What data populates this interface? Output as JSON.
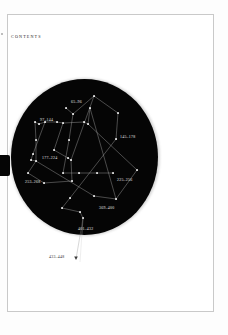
{
  "page": {
    "heading": "CONTENTS",
    "background_color": "#ffffff",
    "frame_color": "#c9c9c9",
    "disc_color": "#050505",
    "star_color": "#ffffff",
    "line_color": "#cfcfcf",
    "label_color": "#e8e8e8"
  },
  "chart_data": {
    "type": "scatter",
    "title": "CONTENTS",
    "xlabel": "",
    "ylabel": "",
    "grid": false,
    "legend_position": "none",
    "labels": [
      {
        "text": "65–96",
        "x": 71,
        "y": 100,
        "placement": "above-cluster"
      },
      {
        "text": "97–144",
        "x": 40,
        "y": 118,
        "placement": "above-cluster"
      },
      {
        "text": "145–178",
        "x": 120,
        "y": 135,
        "placement": "right-cluster"
      },
      {
        "text": "177–224",
        "x": 42,
        "y": 156,
        "placement": "inline-cluster"
      },
      {
        "text": "253–268",
        "x": 25,
        "y": 180,
        "placement": "left-cluster"
      },
      {
        "text": "225–256",
        "x": 117,
        "y": 178,
        "placement": "right-cluster"
      },
      {
        "text": "369–400",
        "x": 99,
        "y": 206,
        "placement": "below-cluster"
      },
      {
        "text": "401–432",
        "x": 78,
        "y": 227,
        "placement": "below-cluster"
      },
      {
        "text": "433–448",
        "x": 49,
        "y": 255,
        "placement": "outside-disc"
      }
    ],
    "stars": [
      {
        "x": 94,
        "y": 96
      },
      {
        "x": 66,
        "y": 108
      },
      {
        "x": 90,
        "y": 108
      },
      {
        "x": 73,
        "y": 114
      },
      {
        "x": 118,
        "y": 113
      },
      {
        "x": 35,
        "y": 122
      },
      {
        "x": 39,
        "y": 124
      },
      {
        "x": 45,
        "y": 122
      },
      {
        "x": 57,
        "y": 122
      },
      {
        "x": 63,
        "y": 123
      },
      {
        "x": 84,
        "y": 122
      },
      {
        "x": 88,
        "y": 124
      },
      {
        "x": 116,
        "y": 139
      },
      {
        "x": 36,
        "y": 140
      },
      {
        "x": 69,
        "y": 140
      },
      {
        "x": 33,
        "y": 154
      },
      {
        "x": 54,
        "y": 150
      },
      {
        "x": 31,
        "y": 160
      },
      {
        "x": 36,
        "y": 161
      },
      {
        "x": 68,
        "y": 158
      },
      {
        "x": 71,
        "y": 160
      },
      {
        "x": 137,
        "y": 170
      },
      {
        "x": 28,
        "y": 173
      },
      {
        "x": 63,
        "y": 173
      },
      {
        "x": 79,
        "y": 173
      },
      {
        "x": 97,
        "y": 173
      },
      {
        "x": 113,
        "y": 173
      },
      {
        "x": 44,
        "y": 183
      },
      {
        "x": 72,
        "y": 181
      },
      {
        "x": 94,
        "y": 196
      },
      {
        "x": 116,
        "y": 199
      },
      {
        "x": 70,
        "y": 198
      },
      {
        "x": 62,
        "y": 208
      },
      {
        "x": 80,
        "y": 212
      },
      {
        "x": 83,
        "y": 218
      }
    ],
    "links": [
      [
        94,
        96,
        118,
        113
      ],
      [
        94,
        96,
        73,
        114
      ],
      [
        66,
        108,
        73,
        114
      ],
      [
        90,
        108,
        88,
        124
      ],
      [
        118,
        113,
        116,
        139
      ],
      [
        35,
        122,
        39,
        124
      ],
      [
        39,
        124,
        45,
        122
      ],
      [
        45,
        122,
        57,
        122
      ],
      [
        57,
        122,
        63,
        123
      ],
      [
        63,
        123,
        84,
        122
      ],
      [
        84,
        122,
        88,
        124
      ],
      [
        35,
        122,
        36,
        140
      ],
      [
        36,
        140,
        36,
        161
      ],
      [
        31,
        160,
        36,
        161
      ],
      [
        33,
        154,
        31,
        160
      ],
      [
        45,
        122,
        33,
        154
      ],
      [
        63,
        123,
        54,
        150
      ],
      [
        54,
        150,
        68,
        158
      ],
      [
        68,
        158,
        71,
        160
      ],
      [
        71,
        160,
        72,
        181
      ],
      [
        72,
        181,
        44,
        183
      ],
      [
        44,
        183,
        28,
        173
      ],
      [
        28,
        173,
        36,
        161
      ],
      [
        73,
        114,
        69,
        140
      ],
      [
        69,
        140,
        63,
        173
      ],
      [
        63,
        173,
        79,
        173
      ],
      [
        79,
        173,
        97,
        173
      ],
      [
        97,
        173,
        113,
        173
      ],
      [
        116,
        139,
        70,
        198
      ],
      [
        70,
        198,
        62,
        208
      ],
      [
        62,
        208,
        80,
        212
      ],
      [
        80,
        212,
        83,
        218
      ],
      [
        94,
        196,
        116,
        199
      ],
      [
        116,
        199,
        137,
        170
      ],
      [
        137,
        170,
        88,
        124
      ],
      [
        90,
        108,
        116,
        199
      ],
      [
        36,
        161,
        94,
        196
      ],
      [
        71,
        160,
        94,
        96
      ],
      [
        83,
        218,
        80,
        262
      ]
    ]
  }
}
